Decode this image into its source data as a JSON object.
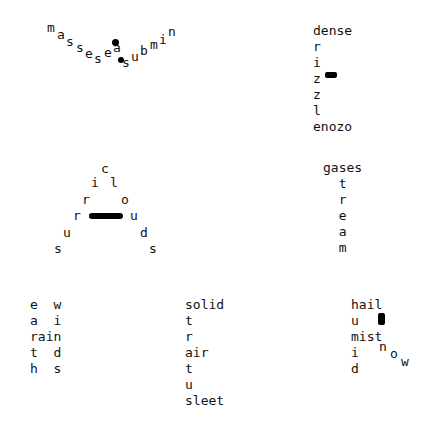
{
  "puzzles": [
    {
      "id": "v-word",
      "words": [
        "masses",
        "seas",
        "submin"
      ],
      "letters": [
        {
          "c": "m",
          "x": 47,
          "y": 21
        },
        {
          "c": "a",
          "x": 57,
          "y": 28
        },
        {
          "c": "s",
          "x": 66,
          "y": 35
        },
        {
          "c": "s",
          "x": 76,
          "y": 41
        },
        {
          "c": "e",
          "x": 85,
          "y": 47
        },
        {
          "c": "s",
          "x": 94,
          "y": 52
        },
        {
          "c": "e",
          "x": 104,
          "y": 46
        },
        {
          "c": "a",
          "x": 113,
          "y": 41
        },
        {
          "c": "s",
          "x": 122,
          "y": 56
        },
        {
          "c": "u",
          "x": 131,
          "y": 50
        },
        {
          "c": "b",
          "x": 140,
          "y": 44
        },
        {
          "c": "m",
          "x": 150,
          "y": 38
        },
        {
          "c": "i",
          "x": 159,
          "y": 33
        },
        {
          "c": "n",
          "x": 168,
          "y": 25
        }
      ],
      "blobs": [
        {
          "x": 112,
          "y": 39,
          "w": 7,
          "h": 7,
          "r": "50%"
        },
        {
          "x": 118,
          "y": 57,
          "w": 6,
          "h": 6,
          "r": "50%"
        }
      ]
    },
    {
      "id": "drizzle",
      "lines": [
        "dense",
        "r",
        "i",
        "z",
        "z",
        "l",
        "enozo"
      ],
      "x": 313,
      "y": 23,
      "blobs": [
        {
          "x": 325,
          "y": 72,
          "w": 12,
          "h": 6,
          "r": "2px"
        }
      ]
    },
    {
      "id": "cirrus",
      "letters": [
        {
          "c": "c",
          "x": 101,
          "y": 162
        },
        {
          "c": "i",
          "x": 91,
          "y": 176
        },
        {
          "c": "l",
          "x": 110,
          "y": 176
        },
        {
          "c": "r",
          "x": 82,
          "y": 193
        },
        {
          "c": "o",
          "x": 121,
          "y": 193
        },
        {
          "c": "r",
          "x": 73,
          "y": 209
        },
        {
          "c": "u",
          "x": 130,
          "y": 209
        },
        {
          "c": "u",
          "x": 63,
          "y": 226
        },
        {
          "c": "d",
          "x": 140,
          "y": 226
        },
        {
          "c": "s",
          "x": 54,
          "y": 242
        },
        {
          "c": "s",
          "x": 149,
          "y": 242
        }
      ],
      "blobs": [
        {
          "x": 89,
          "y": 213,
          "w": 34,
          "h": 6,
          "r": "3px"
        }
      ]
    },
    {
      "id": "gases-stream",
      "lines": [
        "gases",
        "  t",
        "  r",
        "  e",
        "  a",
        "  m"
      ],
      "x": 323,
      "y": 160
    },
    {
      "id": "earth-winds-rain",
      "lines": [
        "e  w",
        "a  i",
        "rain",
        "t  d",
        "h  s"
      ],
      "x": 30,
      "y": 297
    },
    {
      "id": "solid-stratus",
      "lines": [
        "solid",
        "t",
        "r",
        "air",
        "t",
        "u",
        "sleet"
      ],
      "x": 185,
      "y": 297
    },
    {
      "id": "hail-humid",
      "lines": [
        "hail",
        "u",
        "mist",
        "i",
        "d"
      ],
      "x": 351,
      "y": 297,
      "letters": [
        {
          "c": "n",
          "x": 379,
          "y": 340
        },
        {
          "c": "o",
          "x": 390,
          "y": 347
        },
        {
          "c": "w",
          "x": 401,
          "y": 355
        }
      ],
      "blobs": [
        {
          "x": 378,
          "y": 313,
          "w": 7,
          "h": 12,
          "r": "2px"
        }
      ]
    }
  ]
}
